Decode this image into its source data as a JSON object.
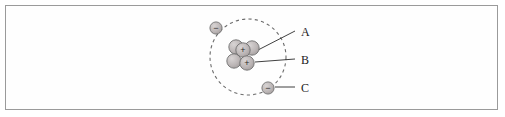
{
  "figure": {
    "border_color": "#9a9a9a",
    "background_color": "#fefefe"
  },
  "orbit": {
    "name": "electron-orbit",
    "center_x": 248,
    "center_y": 57,
    "radius": 38,
    "style": "dashed",
    "stroke_color": "#6d6d6d"
  },
  "nucleus": {
    "center_x": 245,
    "center_y": 55,
    "fill_color": "#b9b3b3",
    "stroke_color": "#6b6b6b",
    "particles": [
      {
        "id": "neutron-1",
        "type": "neutron",
        "sign": "",
        "cx": 236,
        "cy": 47,
        "r": 7
      },
      {
        "id": "neutron-2",
        "type": "neutron",
        "cx": 252,
        "cy": 48,
        "r": 7,
        "sign": ""
      },
      {
        "id": "neutron-3",
        "type": "neutron",
        "cx": 234,
        "cy": 61,
        "r": 7,
        "sign": ""
      },
      {
        "id": "proton-1",
        "type": "proton",
        "sign": "+",
        "cx": 243,
        "cy": 50,
        "r": 7
      },
      {
        "id": "proton-2",
        "type": "proton",
        "sign": "+",
        "cx": 247,
        "cy": 63,
        "r": 7
      }
    ]
  },
  "electrons": [
    {
      "id": "electron-upper-left",
      "sign": "−",
      "cx": 216,
      "cy": 28,
      "r": 6,
      "fill_color": "#b9b3b3",
      "stroke_color": "#6b6b6b"
    },
    {
      "id": "electron-lower-right",
      "sign": "−",
      "cx": 268,
      "cy": 88,
      "r": 6,
      "fill_color": "#b9b3b3",
      "stroke_color": "#6b6b6b"
    }
  ],
  "labels": [
    {
      "id": "label-a",
      "text": "A",
      "text_x": 301,
      "text_y": 36,
      "leader": {
        "x1": 258,
        "y1": 50,
        "x2": 295,
        "y2": 31
      },
      "refers_to": "neutron"
    },
    {
      "id": "label-b",
      "text": "B",
      "text_x": 301,
      "text_y": 64,
      "leader": {
        "x1": 255,
        "y1": 62,
        "x2": 295,
        "y2": 59
      },
      "refers_to": "proton"
    },
    {
      "id": "label-c",
      "text": "C",
      "text_x": 301,
      "text_y": 92,
      "leader": {
        "x1": 275,
        "y1": 87,
        "x2": 295,
        "y2": 87
      },
      "refers_to": "electron"
    }
  ]
}
